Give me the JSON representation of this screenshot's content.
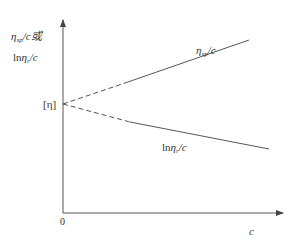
{
  "diagram": {
    "type": "line-plot-schematic",
    "colors": {
      "ink": "#333333",
      "line": "#555555",
      "background": "#ffffff"
    },
    "y_axis": {
      "label_line1": {
        "eta": "η",
        "sub": "sp",
        "rest": "/c或"
      },
      "label_line2": {
        "ln": "ln",
        "eta": "η",
        "sub": "r",
        "rest": "/c"
      }
    },
    "x_axis": {
      "label": "c",
      "origin_label": "0"
    },
    "intercept": {
      "label": "[η]"
    },
    "lines": [
      {
        "name": "reduced-viscosity",
        "label": {
          "eta": "η",
          "sub": "sp",
          "rest": "/c"
        },
        "trend": "increasing",
        "extrapolated_segment": "dashed"
      },
      {
        "name": "inherent-viscosity",
        "label": {
          "ln": "ln",
          "eta": "η",
          "sub": "r",
          "rest": "/c"
        },
        "trend": "decreasing",
        "extrapolated_segment": "dashed"
      }
    ]
  }
}
